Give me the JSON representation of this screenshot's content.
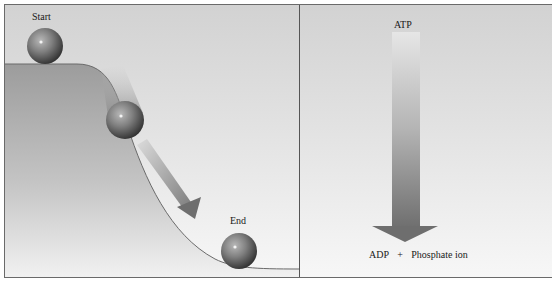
{
  "figure": {
    "left_panel": {
      "title": "Ball rolling downhill",
      "labels": {
        "start": "Start",
        "end": "End"
      },
      "balls": [
        {
          "name": "start",
          "cx": 40,
          "cy": 41,
          "r": 18
        },
        {
          "name": "middle",
          "cx": 120,
          "cy": 115,
          "r": 19
        },
        {
          "name": "end",
          "cx": 234,
          "cy": 246,
          "r": 18
        }
      ]
    },
    "right_panel": {
      "title": "ATP hydrolysis",
      "labels": {
        "top": "ATP",
        "bottom_left": "ADP",
        "plus": "+",
        "bottom_right": "Phosphate ion"
      }
    },
    "colors": {
      "background_top": "#d2d2d2",
      "background_bottom": "#f7f7f7",
      "hill_fill": "#9a9a9a",
      "ball_dark": "#3a3a3a",
      "ball_mid": "#8a8a8a",
      "arrow_dark": "#6e6e6e",
      "border": "#6a6a6a"
    }
  }
}
